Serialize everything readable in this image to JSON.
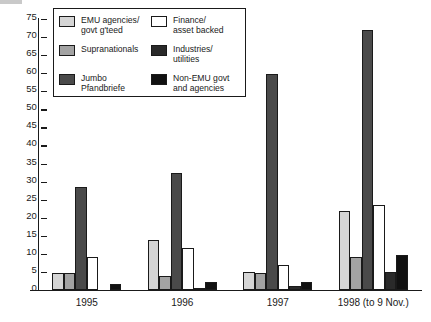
{
  "chart_data": {
    "type": "bar",
    "title": "",
    "subtitle": "",
    "xlabel": "",
    "ylabel": "",
    "ylim": [
      0,
      75
    ],
    "yticks": [
      0,
      5,
      10,
      15,
      20,
      25,
      30,
      35,
      40,
      45,
      50,
      55,
      60,
      65,
      70,
      75
    ],
    "grid": false,
    "legend_position": "top-left-inside",
    "categories": [
      "1995",
      "1996",
      "1997",
      "1998 (to 9 Nov.)"
    ],
    "series": [
      {
        "name": "EMU agencies/\ngovt g'teed",
        "legend_label": "EMU agencies/\ngovt g'teed",
        "color": "#d5d5d5",
        "swatch_name": "swatch-emu-agencies",
        "values": [
          4.7,
          13.8,
          5.0,
          22.0
        ]
      },
      {
        "name": "Supranationals",
        "legend_label": "Supranationals",
        "color": "#a3a3a3",
        "swatch_name": "swatch-supranationals",
        "values": [
          4.8,
          4.0,
          4.7,
          9.2
        ]
      },
      {
        "name": "Jumbo\nPfandbriefe",
        "legend_label": "Jumbo\nPfandbriefe",
        "color": "#4a4a4a",
        "swatch_name": "swatch-jumbo-pfandbriefe",
        "values": [
          28.5,
          32.3,
          59.7,
          72.0
        ]
      },
      {
        "name": "Finance/\nasset backed",
        "legend_label": "Finance/\nasset backed",
        "color": "#ffffff",
        "swatch_name": "swatch-finance-asset-backed",
        "values": [
          9.0,
          11.7,
          6.9,
          23.5
        ]
      },
      {
        "name": "Industries/\nutilities",
        "legend_label": "Industries/\nutilities",
        "color": "#2a2a2a",
        "swatch_name": "swatch-industries-utilities",
        "values": [
          0.0,
          0.5,
          1.2,
          5.0
        ]
      },
      {
        "name": "Non-EMU govt\nand agencies",
        "legend_label": "Non-EMU govt\nand agencies",
        "color": "#111111",
        "swatch_name": "swatch-non-emu-govt",
        "values": [
          1.7,
          2.1,
          2.1,
          9.8
        ]
      }
    ]
  },
  "axis": {
    "y_tick_labels": [
      "75",
      "70",
      "65",
      "60",
      "55",
      "50",
      "45",
      "40",
      "35",
      "30",
      "25",
      "20",
      "15",
      "10",
      "5",
      "0"
    ],
    "x_tick_labels": [
      "1995",
      "1996",
      "1997",
      "1998 (to 9 Nov.)"
    ]
  },
  "colors": {
    "axis": "#1a1a1a",
    "background": "#ffffff",
    "emu_agencies": "#d5d5d5",
    "supranationals": "#a3a3a3",
    "jumbo_pfandbriefe": "#4a4a4a",
    "finance_asset_backed": "#ffffff",
    "industries_utilities": "#2a2a2a",
    "non_emu_govt": "#111111"
  }
}
